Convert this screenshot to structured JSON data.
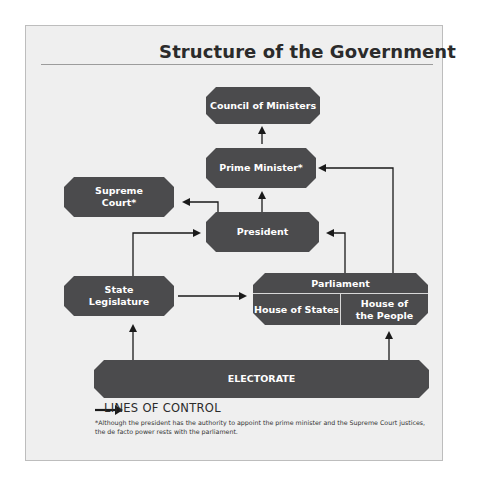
{
  "title": "Structure of the Government",
  "nodes": {
    "council_of_ministers": "Council of Ministers",
    "prime_minister": "Prime Minister*",
    "supreme_court": "Supreme Court*",
    "president": "President",
    "state_legislature": "State Legislature",
    "parliament": {
      "label": "Parliament",
      "house_of_states": "House of States",
      "house_of_the_people": "House of the People"
    },
    "electorate": "ELECTORATE"
  },
  "edges": [
    {
      "from": "Prime Minister*",
      "to": "Council of Ministers"
    },
    {
      "from": "President",
      "to": "Prime Minister*"
    },
    {
      "from": "President",
      "to": "Supreme Court*"
    },
    {
      "from": "State Legislature",
      "to": "President"
    },
    {
      "from": "State Legislature",
      "to": "Parliament"
    },
    {
      "from": "Parliament",
      "to": "President"
    },
    {
      "from": "Parliament",
      "to": "Prime Minister*"
    },
    {
      "from": "ELECTORATE",
      "to": "State Legislature"
    },
    {
      "from": "ELECTORATE",
      "to": "House of the People"
    }
  ],
  "legend": {
    "icon": "arrow-right-icon",
    "label": "LINES OF CONTROL"
  },
  "footnote": "*Although the president has the authority to appoint the prime minister and the Supreme Court justices, the de facto power rests with the parliament.",
  "colors": {
    "node_fill": "#4b4b4d",
    "background": "#efefef",
    "line": "#1a1a1a"
  }
}
